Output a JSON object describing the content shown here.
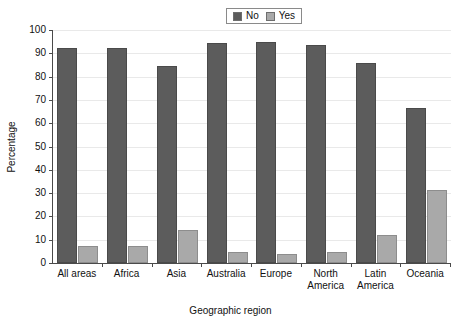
{
  "chart_data": {
    "type": "bar",
    "title": "",
    "xlabel": "Geographic region",
    "ylabel": "Percentage",
    "ylim": [
      0,
      100
    ],
    "yticks": [
      0,
      10,
      20,
      30,
      40,
      50,
      60,
      70,
      80,
      90,
      100
    ],
    "grid": true,
    "legend_position": "top-center",
    "categories": [
      "All areas",
      "Africa",
      "Asia",
      "Australia",
      "Europe",
      "North\nAmerica",
      "Latin\nAmerica",
      "Oceania"
    ],
    "series": [
      {
        "name": "No",
        "color": "#5c5c5c",
        "values": [
          92.3,
          92.2,
          84.7,
          94.4,
          95.0,
          93.6,
          86.0,
          66.6
        ]
      },
      {
        "name": "Yes",
        "color": "#a9a9a9",
        "values": [
          7.5,
          7.3,
          14.1,
          4.7,
          3.8,
          4.8,
          12.0,
          31.2
        ]
      }
    ]
  },
  "legend": {
    "entries": [
      {
        "label": "No",
        "color": "#5c5c5c"
      },
      {
        "label": "Yes",
        "color": "#a9a9a9"
      }
    ]
  },
  "axes": {
    "y_title": "Percentage",
    "x_title": "Geographic region",
    "y_tick_labels": [
      "0",
      "10",
      "20",
      "30",
      "40",
      "50",
      "60",
      "70",
      "80",
      "90",
      "100"
    ]
  }
}
